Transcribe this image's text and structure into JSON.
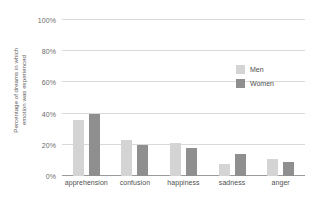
{
  "chart_data": {
    "type": "bar",
    "title": "",
    "subtitle": "",
    "xlabel": "",
    "ylabel": "Percentage of dreams in which emotion was experienced",
    "ylabel_lines": [
      "Percentage of dreams in which",
      "emotion was experienced"
    ],
    "categories": [
      "apprehension",
      "confusion",
      "happiness",
      "sadness",
      "anger"
    ],
    "series": [
      {
        "name": "Men",
        "color": "#d4d4d4",
        "values": [
          36,
          23,
          21,
          8,
          11
        ]
      },
      {
        "name": "Women",
        "color": "#8f8f8f",
        "values": [
          40,
          20,
          18,
          14,
          9
        ]
      }
    ],
    "ylim": [
      0,
      100
    ],
    "ytick_values": [
      0,
      20,
      40,
      60,
      80,
      100
    ],
    "ytick_labels": [
      "0%",
      "20%",
      "40%",
      "60%",
      "80%",
      "100%"
    ],
    "grid": true,
    "grid_axis": "y",
    "grid_color": "#d9d9d9",
    "legend_position": "inside-upper-right",
    "axis_color": "#9a9a9a",
    "background": "#ffffff"
  },
  "legend": {
    "items": [
      {
        "label": "Men",
        "color": "#d4d4d4"
      },
      {
        "label": "Women",
        "color": "#8f8f8f"
      }
    ]
  }
}
